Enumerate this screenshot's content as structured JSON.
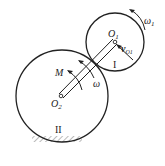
{
  "diagram": {
    "labels": {
      "omega1": "ω",
      "omega1_sub": "1",
      "O1": "O",
      "O1_sub": "1",
      "vO1": "v",
      "vO1_sub": "O1",
      "gear_small": "I",
      "M": "M",
      "omega": "ω",
      "O2": "O",
      "O2_sub": "2",
      "gear_big": "II"
    },
    "colors": {
      "stroke": "#222222",
      "background": "#ffffff"
    }
  }
}
